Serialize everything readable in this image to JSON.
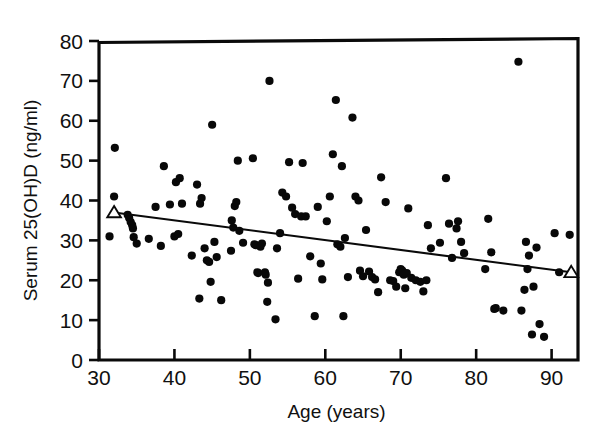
{
  "chart_data": {
    "type": "scatter",
    "title": "",
    "xlabel": "Age (years)",
    "ylabel": "Serum 25(OH)D (ng/ml)",
    "xlim": [
      30,
      93.5
    ],
    "ylim": [
      0,
      80
    ],
    "xticks": [
      30,
      40,
      50,
      60,
      70,
      80,
      90
    ],
    "yticks": [
      0,
      10,
      20,
      30,
      40,
      50,
      60,
      70,
      80
    ],
    "xtick_labels": [
      "30",
      "40",
      "50",
      "60",
      "70",
      "80",
      "90"
    ],
    "ytick_labels": [
      "0",
      "10",
      "20",
      "30",
      "40",
      "50",
      "60",
      "70",
      "80"
    ],
    "grid": false,
    "legend": false,
    "marker": "filled-circle",
    "marker_color": "#080808",
    "series": [
      {
        "name": "Serum 25(OH)D vs Age",
        "x": [
          31.4,
          32.0,
          32.1,
          33.8,
          34.0,
          34.2,
          34.4,
          34.5,
          34.6,
          35.0,
          36.6,
          37.5,
          38.2,
          38.6,
          39.4,
          40.0,
          40.2,
          40.5,
          40.7,
          41.0,
          42.3,
          43.0,
          43.3,
          43.4,
          43.6,
          44.0,
          44.3,
          44.6,
          44.8,
          45.0,
          45.3,
          45.6,
          46.2,
          47.5,
          47.6,
          47.8,
          48.0,
          48.2,
          48.4,
          48.6,
          49.1,
          50.4,
          50.6,
          50.8,
          51.0,
          51.1,
          51.4,
          51.6,
          52.0,
          52.1,
          52.3,
          52.4,
          52.6,
          53.4,
          53.6,
          54.0,
          54.3,
          54.8,
          55.2,
          55.6,
          56.0,
          56.4,
          56.8,
          57.0,
          57.4,
          58.0,
          58.6,
          59.0,
          59.4,
          59.6,
          60.2,
          60.6,
          61.0,
          61.4,
          61.6,
          62.0,
          62.2,
          62.4,
          62.6,
          63.0,
          63.6,
          64.0,
          64.4,
          64.6,
          65.0,
          65.4,
          65.8,
          66.2,
          66.6,
          67.0,
          67.4,
          68.0,
          68.6,
          69.0,
          69.4,
          69.8,
          70.0,
          70.2,
          70.4,
          70.6,
          70.8,
          71.0,
          71.4,
          72.0,
          72.6,
          73.0,
          73.4,
          73.6,
          74.0,
          75.2,
          76.0,
          76.4,
          76.8,
          77.4,
          77.6,
          78.0,
          78.4,
          81.2,
          81.6,
          82.0,
          82.4,
          82.6,
          83.6,
          85.6,
          86.0,
          86.4,
          86.6,
          86.8,
          87.0,
          87.4,
          87.6,
          88.0,
          88.4,
          89.0,
          90.4,
          91.0,
          92.4
        ],
        "y": [
          31.0,
          41.0,
          53.2,
          36.4,
          35.6,
          34.6,
          33.8,
          33.0,
          30.8,
          29.2,
          30.4,
          38.4,
          28.6,
          48.6,
          39.0,
          31.0,
          44.6,
          31.6,
          45.6,
          39.2,
          26.2,
          44.0,
          15.4,
          39.2,
          40.6,
          28.0,
          25.0,
          24.6,
          19.6,
          59.0,
          29.6,
          25.8,
          15.0,
          27.4,
          35.0,
          33.2,
          38.6,
          39.6,
          50.0,
          32.4,
          29.4,
          50.6,
          29.0,
          28.8,
          22.0,
          21.8,
          28.4,
          29.2,
          22.0,
          21.4,
          14.6,
          19.4,
          70.0,
          10.2,
          28.0,
          31.8,
          42.0,
          41.0,
          49.6,
          38.2,
          36.6,
          20.4,
          36.0,
          49.4,
          36.0,
          26.0,
          11.0,
          38.4,
          24.2,
          20.2,
          34.8,
          41.0,
          51.6,
          65.2,
          29.0,
          28.4,
          48.6,
          11.0,
          30.6,
          20.8,
          60.8,
          41.0,
          40.0,
          22.4,
          21.0,
          32.6,
          22.2,
          20.8,
          20.2,
          17.0,
          45.8,
          39.6,
          20.0,
          19.8,
          18.4,
          22.0,
          22.8,
          22.4,
          21.4,
          18.0,
          21.8,
          38.0,
          20.6,
          20.0,
          19.6,
          17.2,
          20.0,
          33.8,
          28.0,
          29.4,
          45.6,
          34.2,
          25.6,
          33.0,
          34.8,
          29.6,
          26.8,
          22.8,
          35.4,
          27.0,
          12.8,
          13.0,
          12.4,
          74.8,
          12.4,
          17.6,
          29.6,
          22.8,
          26.2,
          6.4,
          18.4,
          28.2,
          9.0,
          5.8,
          31.8,
          22.0,
          31.4
        ]
      }
    ],
    "trend_line": {
      "name": "regression-line",
      "x_start": 32.0,
      "y_start": 37.0,
      "x_end": 92.6,
      "y_end": 22.0,
      "endpoint_marker": "open-triangle"
    },
    "n_points": 137
  },
  "axes": {
    "x_axis_title": "Age (years)",
    "y_axis_title": "Serum 25(OH)D (ng/ml)"
  },
  "colors": {
    "background": "#ffffff",
    "ink": "#0a0a0a",
    "marker": "#080808"
  }
}
